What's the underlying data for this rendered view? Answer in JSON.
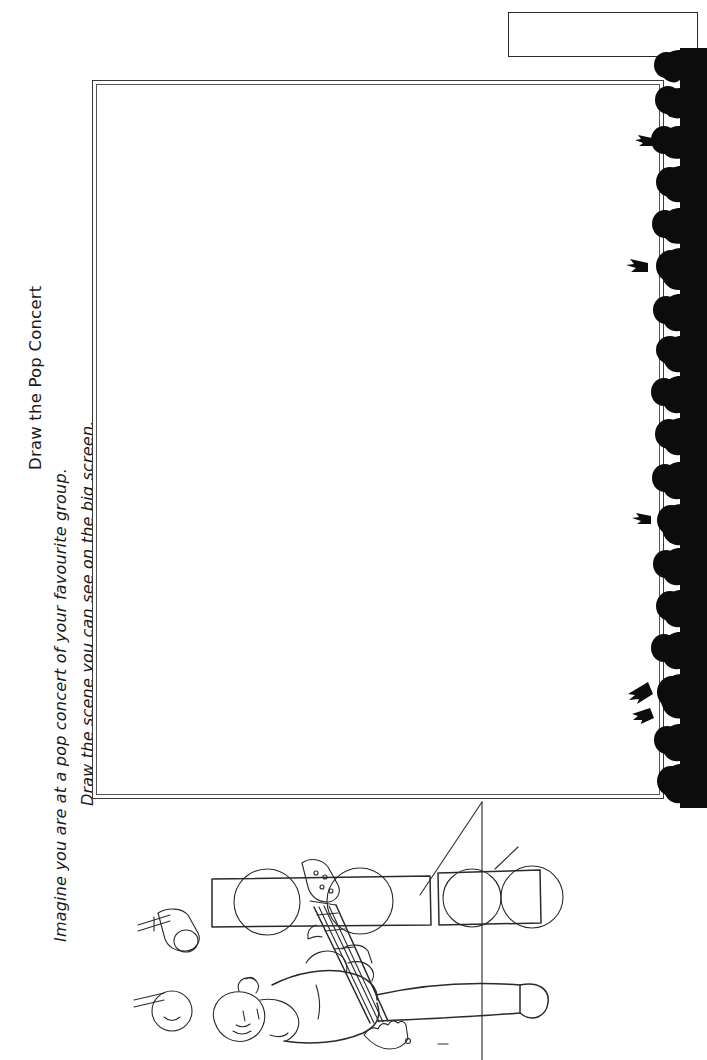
{
  "worksheet": {
    "title": "Draw the Pop Concert",
    "instructions": [
      "Imagine you are at a pop concert of your favourite group.",
      "Draw the scene you can see on the big screen."
    ],
    "name_box": {
      "label": "",
      "value": ""
    },
    "drawing_area": {
      "label": "",
      "value": ""
    },
    "orientation": "rotated-90-ccw",
    "colors": {
      "ink": "#2a2a2a",
      "silhouette": "#0c0c0c",
      "paper": "#ffffff"
    }
  },
  "illustration": {
    "name": "pop-concert-stage-scene",
    "elements": [
      "guitarist",
      "speaker-cabinet-left",
      "speaker-cabinet-right",
      "microphone-upper",
      "microphone-lower",
      "audience-crowd-silhouette"
    ]
  }
}
